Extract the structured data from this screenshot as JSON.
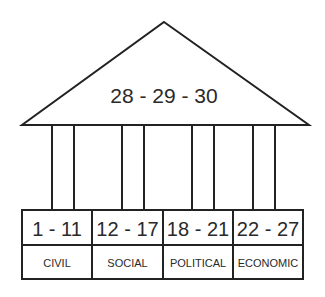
{
  "diagram": {
    "type": "temple",
    "roof": {
      "label": "28 - 29 - 30"
    },
    "columns": [
      {
        "range": "1 - 11",
        "category": "CIVIL"
      },
      {
        "range": "12 - 17",
        "category": "SOCIAL"
      },
      {
        "range": "18 - 21",
        "category": "POLITICAL"
      },
      {
        "range": "22 - 27",
        "category": "ECONOMIC"
      }
    ],
    "colors": {
      "stroke": "#222222",
      "background": "#ffffff",
      "text": "#2a2a2a"
    }
  }
}
